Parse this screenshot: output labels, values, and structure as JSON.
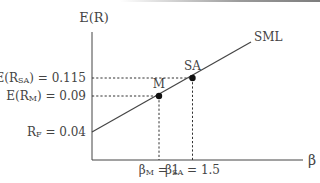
{
  "chart_data": {
    "type": "line",
    "title": "",
    "xlabel": "β",
    "ylabel": "E(R)",
    "xlim": [
      0,
      2.5
    ],
    "ylim": [
      0.0,
      0.165
    ],
    "grid": false,
    "series": [
      {
        "name": "SML",
        "label": "SML",
        "x": [
          0,
          2.0
        ],
        "y": [
          0.04,
          0.14
        ],
        "color": "#444444"
      }
    ],
    "points": [
      {
        "name": "M",
        "label": "M",
        "x": 1.0,
        "y": 0.09
      },
      {
        "name": "SA",
        "label": "SA",
        "x": 1.5,
        "y": 0.115
      }
    ],
    "y_annotations": [
      {
        "id": "rf",
        "value": 0.04,
        "main": "R",
        "sub": "F",
        "suffix": " = 0.04"
      },
      {
        "id": "erm",
        "value": 0.09,
        "main": "E(R",
        "sub": "M",
        "suffix": ") = 0.09"
      },
      {
        "id": "ersa",
        "value": 0.115,
        "main": "E(R",
        "sub": "SA",
        "suffix": ") = 0.115"
      }
    ],
    "x_annotations": [
      {
        "id": "bm",
        "value": 1.0,
        "main": "β",
        "sub": "M",
        "suffix": " = 1"
      },
      {
        "id": "bsa",
        "value": 1.5,
        "main": "β",
        "sub": "SA",
        "suffix": " = 1.5"
      }
    ]
  },
  "colors": {
    "axis": "#444444",
    "line": "#444444",
    "point": "#111111",
    "text": "#444444"
  }
}
